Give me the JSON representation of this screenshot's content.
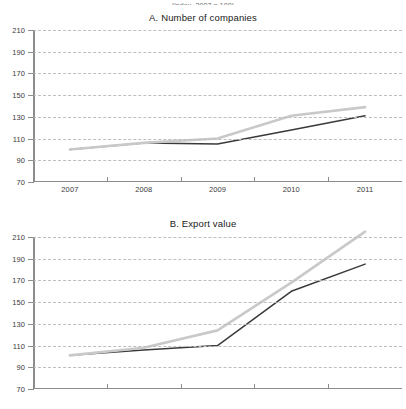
{
  "header": {
    "cutoff_text": "(index, 2007 = 100)"
  },
  "panels": [
    {
      "title": "A. Number of companies",
      "y_ticks": [
        210,
        190,
        170,
        150,
        130,
        110,
        90,
        70
      ],
      "x_ticks": [
        "2007",
        "2008",
        "2009",
        "2010",
        "2011"
      ],
      "x_labels_visible": true
    },
    {
      "title": "B. Export value",
      "y_ticks": [
        210,
        190,
        170,
        150,
        130,
        110,
        90,
        70
      ],
      "x_ticks": [
        "2007",
        "2008",
        "2009",
        "2010",
        "2011"
      ],
      "x_labels_visible": false
    }
  ],
  "colors": {
    "series_dark": "#3a3a3a",
    "series_light": "#c9c9c9",
    "axis": "#8c8c8c",
    "grid": "#bdbdc4",
    "text": "#1a1a1a"
  },
  "chart_data": [
    {
      "type": "line",
      "title": "A. Number of companies",
      "xlabel": "",
      "ylabel": "",
      "x": [
        "2007",
        "2008",
        "2009",
        "2010",
        "2011"
      ],
      "ylim": [
        70,
        210
      ],
      "ytick_step": 20,
      "grid": true,
      "legend": "none",
      "series": [
        {
          "name": "dark-series",
          "color": "#3a3a3a",
          "values": [
            100,
            106,
            105,
            118,
            131
          ]
        },
        {
          "name": "light-series",
          "color": "#c9c9c9",
          "values": [
            100,
            106,
            110,
            131,
            139
          ]
        }
      ]
    },
    {
      "type": "line",
      "title": "B. Export value",
      "xlabel": "",
      "ylabel": "",
      "x": [
        "2007",
        "2008",
        "2009",
        "2010",
        "2011"
      ],
      "ylim": [
        70,
        210
      ],
      "ytick_step": 20,
      "grid": true,
      "legend": "none",
      "series": [
        {
          "name": "dark-series",
          "color": "#3a3a3a",
          "values": [
            101,
            106,
            110,
            160,
            185
          ]
        },
        {
          "name": "light-series",
          "color": "#c9c9c9",
          "values": [
            101,
            108,
            124,
            168,
            215
          ]
        }
      ]
    }
  ]
}
